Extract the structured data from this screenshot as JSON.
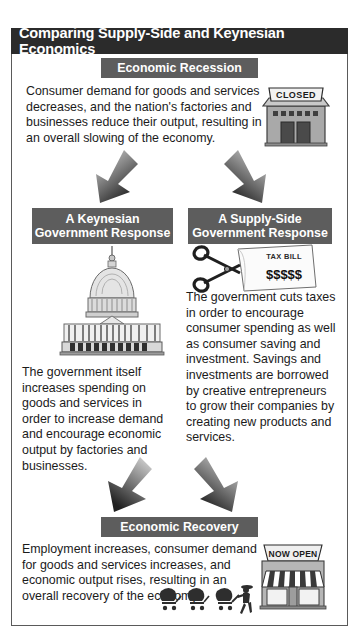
{
  "figure": {
    "title": "Comparing Supply-Side and Keynesian Economics",
    "frame_border_color": "#5a5a5a",
    "title_bar_color": "#2b2b2b",
    "section_bar_color": "#5d5d5d",
    "text_color": "#1b1b1b"
  },
  "sections": {
    "recession": {
      "heading": "Economic Recession",
      "body": "Consumer demand for goods and services decreases, and the nation's factories and businesses reduce their output, resulting in an overall slowing of the economy.",
      "illustration_label": "closed-store-icon",
      "illustration_text": "CLOSED"
    },
    "keynesian": {
      "heading_line1": "A Keynesian",
      "heading_line2": "Government Response",
      "body": "The government itself increases spending on goods and services in order to increase demand and encourage economic output by factories and businesses.",
      "illustration_label": "capitol-building-icon"
    },
    "supply_side": {
      "heading_line1": "A Supply-Side",
      "heading_line2": "Government Response",
      "body": "The government cuts taxes in order to encourage consumer spending as well as consumer saving and investment. Savings and investments are borrowed by creative entrepreneurs to grow their companies by creating new products and services.",
      "illustration_label": "scissors-cutting-tax-bill-icon",
      "illustration_text_bill": "TAX BILL",
      "illustration_text_money": "$$$$$"
    },
    "recovery": {
      "heading": "Economic Recovery",
      "body": "Employment increases, consumer demand for goods and services increases, and economic output rises, resulting in an overall recovery of the economy.",
      "illustration_label": "open-store-icon",
      "illustration_text": "NOW OPEN",
      "shoppers_label": "shoppers-with-carts-icon"
    }
  },
  "arrows": {
    "recession_to_keynesian": "down-left-arrow",
    "recession_to_supply_side": "down-right-arrow",
    "keynesian_to_recovery": "down-right-arrow",
    "supply_side_to_recovery": "down-left-arrow"
  }
}
